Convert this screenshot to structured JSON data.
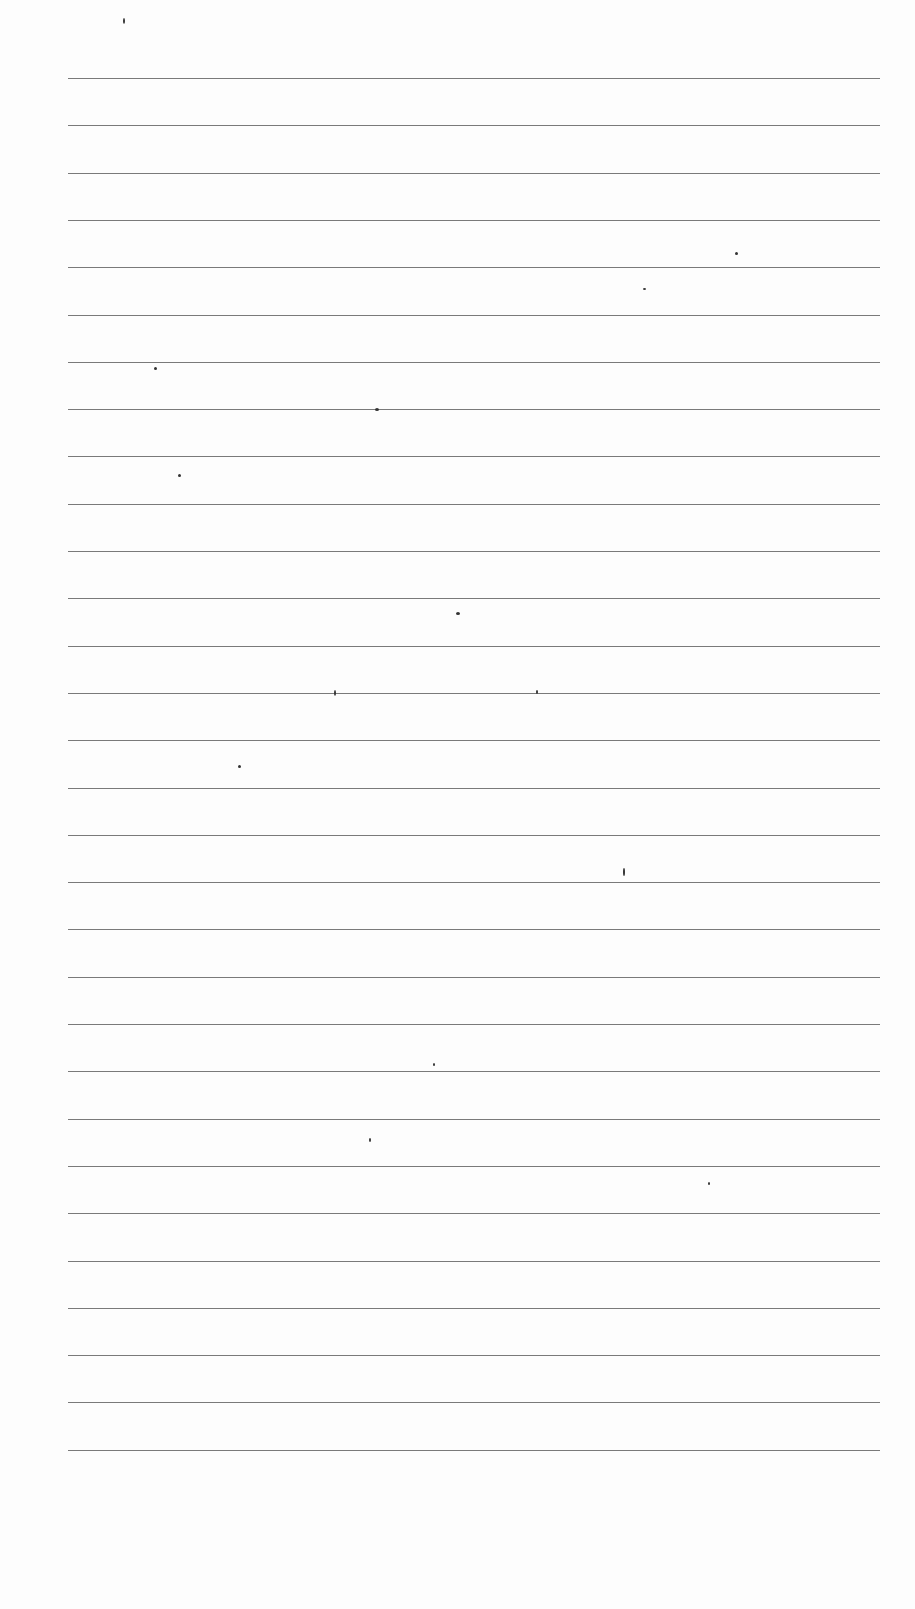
{
  "document": {
    "type": "lined-paper",
    "line_count": 30,
    "line_left_x": 68,
    "line_right_x": 880,
    "first_line_y": 78,
    "line_spacing": 47.3,
    "line_color": "#7a7a7a",
    "background_color": "#fdfdfd",
    "text": []
  }
}
